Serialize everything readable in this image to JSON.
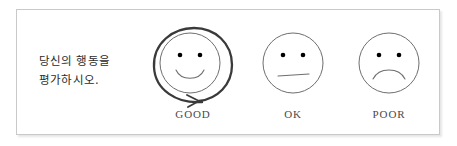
{
  "panel": {
    "background_color": "#ffffff",
    "border_color": "#c9c9c9"
  },
  "prompt": {
    "line1": "당신의 행동을",
    "line2": "평가하시오.",
    "text_color": "#2b2b2b"
  },
  "rating_scale": {
    "options": [
      {
        "id": "good",
        "label": "GOOD",
        "face": "smiling-face",
        "mouth": "smile-curve",
        "outline": "spiral-double-circle",
        "outline_color": "#3a3a3a",
        "emphasis": true
      },
      {
        "id": "ok",
        "label": "OK",
        "face": "neutral-face",
        "mouth": "straight-line",
        "outline": "single-circle",
        "outline_color": "#6e6e6e",
        "emphasis": false
      },
      {
        "id": "poor",
        "label": "POOR",
        "face": "frowning-face",
        "mouth": "frown-curve",
        "outline": "single-circle",
        "outline_color": "#6e6e6e",
        "emphasis": false
      }
    ],
    "label_color": "#4a4a4a",
    "eye_color": "#000000"
  }
}
